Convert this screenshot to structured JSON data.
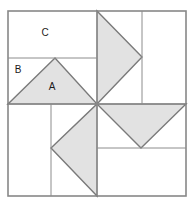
{
  "figure": {
    "name": "pinwheel-quilt-block-diagram",
    "background_color": "#ffffff",
    "outer_border": {
      "x": 8,
      "y": 11,
      "width": 178,
      "height": 185,
      "stroke_color": "#888888",
      "stroke_width": 1.6,
      "fill_color": "#ffffff"
    },
    "center_point": {
      "x": 97,
      "y": 104
    },
    "grid_lines": {
      "stroke_color": "#8c8c8c",
      "stroke_width": 1,
      "vertical_center": {
        "x": 97,
        "y1": 11,
        "y2": 196
      },
      "horizontal_center": {
        "x1": 8,
        "x2": 186,
        "y": 104
      }
    },
    "quadrant_divider_lines": {
      "stroke_color": "#8c8c8c",
      "stroke_width": 1,
      "top_left_horizontal": {
        "x1": 8,
        "x2": 97,
        "y": 58
      },
      "top_right_vertical": {
        "x": 142,
        "y1": 11,
        "y2": 104
      },
      "bottom_right_horizontal": {
        "x1": 97,
        "x2": 186,
        "y": 148
      },
      "bottom_left_vertical": {
        "x": 51,
        "y1": 104,
        "y2": 196
      }
    },
    "triangles": [
      {
        "name": "triangle-a-top-left",
        "points": "8,104 55,58 97,104",
        "direction": "up",
        "fill_color": "#e2e2e2",
        "stroke_color": "#7a7a7a",
        "stroke_width": 1.4
      },
      {
        "name": "triangle-top-right",
        "points": "97,11 142,57 97,104",
        "direction": "right",
        "fill_color": "#e2e2e2",
        "stroke_color": "#7a7a7a",
        "stroke_width": 1.4
      },
      {
        "name": "triangle-bottom-right",
        "points": "97,104 186,104 141,148",
        "direction": "down",
        "fill_color": "#e2e2e2",
        "stroke_color": "#7a7a7a",
        "stroke_width": 1.4
      },
      {
        "name": "triangle-bottom-left",
        "points": "97,104 97,196 51,148",
        "direction": "left",
        "fill_color": "#e2e2e2",
        "stroke_color": "#7a7a7a",
        "stroke_width": 1.4
      }
    ],
    "labels": [
      {
        "name": "label-c",
        "text": "C",
        "x": 45,
        "y": 33
      },
      {
        "name": "label-b",
        "text": "B",
        "x": 18,
        "y": 70
      },
      {
        "name": "label-a",
        "text": "A",
        "x": 52,
        "y": 87
      }
    ]
  }
}
